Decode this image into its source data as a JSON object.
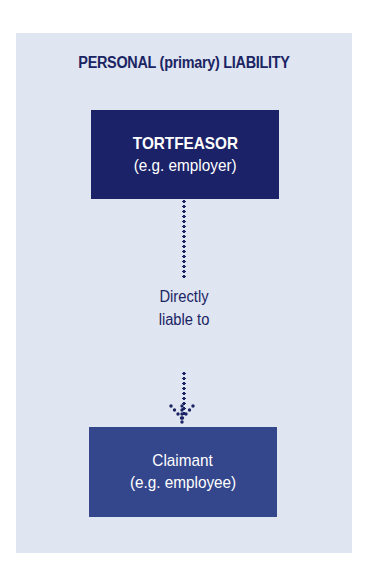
{
  "diagram": {
    "title": "PERSONAL (primary) LIABILITY",
    "top_box": {
      "line1": "TORTFEASOR",
      "line2": "(e.g. employer)"
    },
    "relationship": {
      "line1": "Directly",
      "line2": "liable to"
    },
    "bottom_box": {
      "line1": "Claimant",
      "line2": "(e.g. employee)"
    },
    "colors": {
      "panel_background": "#dfe5f1",
      "title_text": "#1b2463",
      "top_box_fill": "#1b2267",
      "bottom_box_fill": "#34468c",
      "box_text": "#ffffff",
      "connector": "#1b2463"
    }
  }
}
